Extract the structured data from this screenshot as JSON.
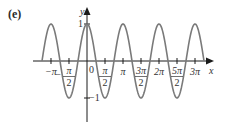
{
  "panel_label": "(e)",
  "chart_data": {
    "type": "line",
    "title": "",
    "function": "y = cos(2x)",
    "xlabel": "x",
    "ylabel": "y",
    "x_ticks": [
      "−π",
      "−π/2",
      "0",
      "π/2",
      "π",
      "3π/2",
      "2π",
      "5π/2",
      "3π"
    ],
    "x_tick_values": [
      -3.1416,
      -1.5708,
      0,
      1.5708,
      3.1416,
      4.7124,
      6.2832,
      7.854,
      9.4248
    ],
    "y_ticks": [
      "1",
      "−1"
    ],
    "y_tick_values": [
      1,
      -1
    ],
    "xlim": [
      -3.927,
      10.21
    ],
    "ylim": [
      -1,
      1
    ],
    "series": [
      {
        "name": "cos(2x)",
        "x_range": [
          -3.927,
          10.21
        ],
        "peaks_at": [
          "−π",
          "0",
          "π",
          "2π",
          "3π"
        ],
        "troughs_at": [
          "−π/2",
          "π/2",
          "3π/2",
          "5π/2"
        ]
      }
    ],
    "grid": false,
    "legend": null,
    "colors": {
      "curve": "#7a7a7a",
      "axes": "#1a1a1a"
    }
  }
}
